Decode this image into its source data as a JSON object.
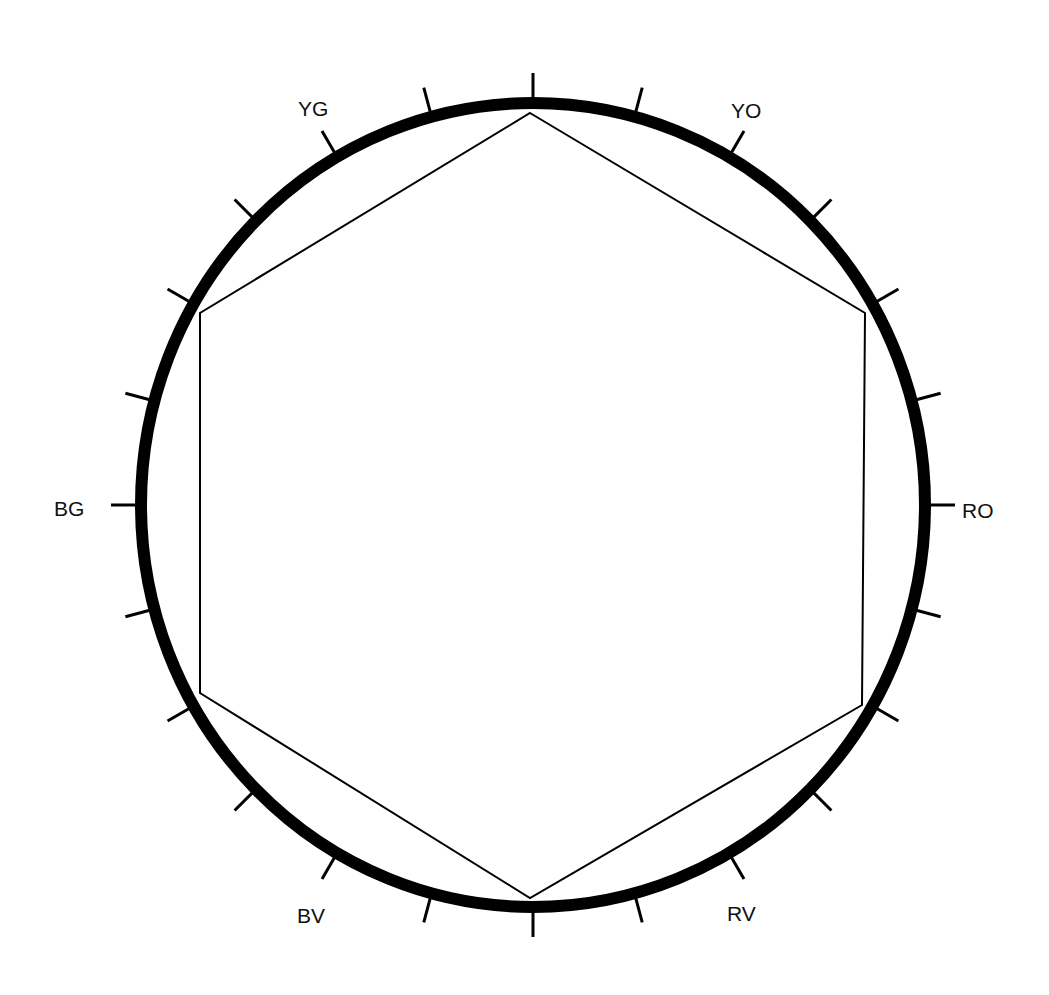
{
  "diagram": {
    "type": "color-wheel-hexagon",
    "colors": {
      "ink": "#000000",
      "background": "#ffffff"
    },
    "circle": {
      "cx": 533,
      "cy": 505,
      "rx": 392,
      "ry": 402,
      "stroke_width": 12
    },
    "ticks": {
      "count": 24,
      "step_degrees": 15,
      "length": 30,
      "stroke_width": 3
    },
    "hexagon": {
      "stroke_width": 2,
      "vertices": [
        [
          530,
          113
        ],
        [
          865,
          313
        ],
        [
          862,
          705
        ],
        [
          530,
          898
        ],
        [
          200,
          693
        ],
        [
          200,
          313
        ]
      ]
    },
    "labels": [
      {
        "text": "YG",
        "x": 298,
        "y": 98
      },
      {
        "text": "YO",
        "x": 731,
        "y": 100
      },
      {
        "text": "BG",
        "x": 54,
        "y": 498
      },
      {
        "text": "RO",
        "x": 962,
        "y": 500
      },
      {
        "text": "BV",
        "x": 297,
        "y": 905
      },
      {
        "text": "RV",
        "x": 727,
        "y": 903
      }
    ]
  }
}
